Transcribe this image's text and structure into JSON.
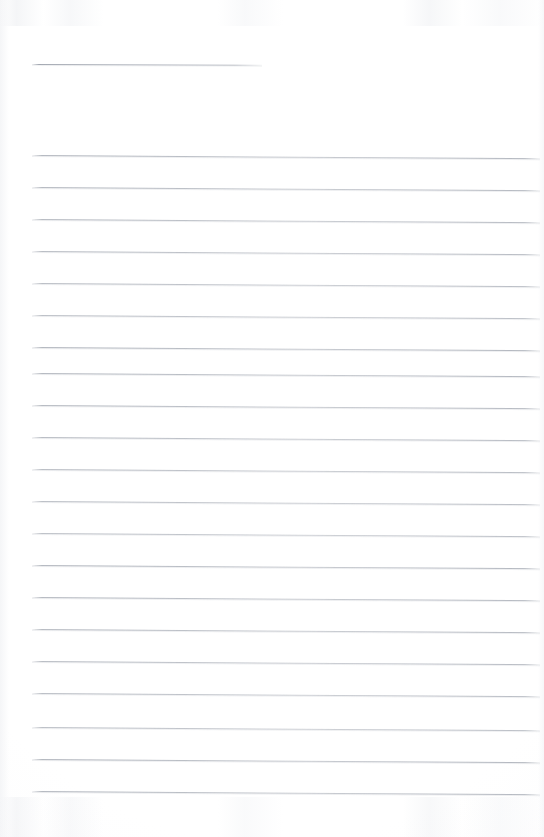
{
  "document": {
    "kind": "scanned-ruled-notepad-page",
    "title": "",
    "visible_text": "",
    "page_number": "",
    "background_color": "#ffffff",
    "rule_color": "#a8adb6",
    "page_width": 544,
    "page_height": 837
  },
  "header_rule": {
    "name": "header-rule",
    "x": 32,
    "y": 64,
    "width": 230,
    "slope_px": 0.8
  },
  "ruled_area": {
    "left": 32,
    "right": 540,
    "first_line_y": 155,
    "line_spacing": 32,
    "line_count": 21,
    "slope_px": 3.2,
    "lines": [
      {
        "index": 1,
        "y": 155
      },
      {
        "index": 2,
        "y": 187
      },
      {
        "index": 3,
        "y": 219
      },
      {
        "index": 4,
        "y": 251
      },
      {
        "index": 5,
        "y": 283
      },
      {
        "index": 6,
        "y": 315
      },
      {
        "index": 7,
        "y": 347
      },
      {
        "index": 8,
        "y": 373
      },
      {
        "index": 9,
        "y": 405
      },
      {
        "index": 10,
        "y": 437
      },
      {
        "index": 11,
        "y": 469
      },
      {
        "index": 12,
        "y": 501
      },
      {
        "index": 13,
        "y": 533
      },
      {
        "index": 14,
        "y": 565
      },
      {
        "index": 15,
        "y": 597
      },
      {
        "index": 16,
        "y": 629
      },
      {
        "index": 17,
        "y": 661
      },
      {
        "index": 18,
        "y": 693
      },
      {
        "index": 19,
        "y": 727
      },
      {
        "index": 20,
        "y": 759
      },
      {
        "index": 21,
        "y": 791
      }
    ]
  }
}
